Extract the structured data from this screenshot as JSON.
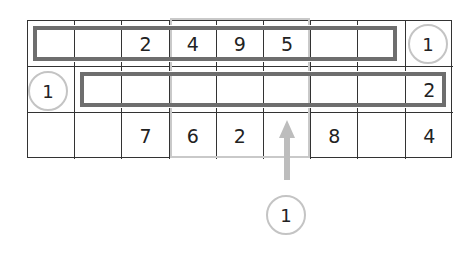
{
  "puzzle": {
    "rows": 3,
    "cols": 9,
    "cells": [
      [
        "",
        "",
        "2",
        "4",
        "9",
        "5",
        "",
        "",
        "1"
      ],
      [
        "1",
        "",
        "",
        "",
        "",
        "",
        "",
        "",
        "2"
      ],
      [
        "",
        "",
        "7",
        "6",
        "2",
        "",
        "8",
        "",
        "4"
      ]
    ],
    "snakes": [
      {
        "row": 0,
        "from_col": 0,
        "to_col": 7
      },
      {
        "row": 1,
        "from_col": 1,
        "to_col": 8
      }
    ],
    "circled_clues": [
      {
        "row": 0,
        "col": 8,
        "value": "1"
      },
      {
        "row": 1,
        "col": 0,
        "value": "1"
      }
    ],
    "highlight_columns": [
      3,
      4,
      5
    ],
    "arrow": {
      "column": 5,
      "direction": "up"
    },
    "bottom_clue": {
      "value": "1"
    }
  },
  "colors": {
    "grid_line": "#333333",
    "snake_border": "#6e6e6e",
    "highlight": "#c9c9c9",
    "clue_circle": "#c4c4c4",
    "arrow": "#bdbdbd"
  }
}
